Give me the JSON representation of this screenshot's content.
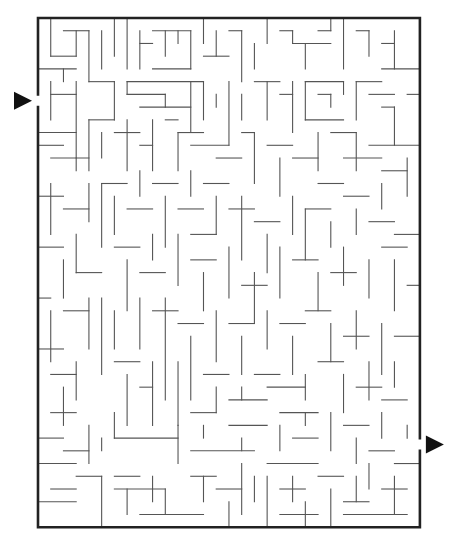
{
  "puzzle": {
    "type": "maze",
    "cols": 30,
    "rows": 40,
    "origin": [
      38,
      18
    ],
    "cell": 12.73,
    "entrance": {
      "side": "left",
      "row": 6,
      "arrow": "right-pointing-triangle"
    },
    "exit": {
      "side": "right",
      "row": 33,
      "arrow": "right-pointing-triangle"
    },
    "colors": {
      "wall": "#555555",
      "border": "#222222",
      "arrow": "#111111",
      "background": "#ffffff"
    }
  },
  "walls": [
    [
      1,
      0,
      1,
      3
    ],
    [
      1,
      3,
      3,
      3
    ],
    [
      3,
      3,
      3,
      1
    ],
    [
      2,
      1,
      4,
      1
    ],
    [
      4,
      1,
      4,
      5
    ],
    [
      5,
      1,
      5,
      4
    ],
    [
      6,
      0,
      6,
      3
    ],
    [
      7,
      0,
      7,
      4
    ],
    [
      8,
      1,
      8,
      4
    ],
    [
      8,
      2,
      9,
      2
    ],
    [
      9,
      1,
      12,
      1
    ],
    [
      10,
      1,
      10,
      3
    ],
    [
      11,
      1,
      11,
      2
    ],
    [
      12,
      1,
      12,
      4
    ],
    [
      9,
      4,
      12,
      4
    ],
    [
      13,
      0,
      13,
      2
    ],
    [
      13,
      3,
      15,
      3
    ],
    [
      14,
      1,
      14,
      3
    ],
    [
      15,
      1,
      16,
      1
    ],
    [
      16,
      1,
      16,
      5
    ],
    [
      17,
      2,
      17,
      4
    ],
    [
      18,
      0,
      18,
      2
    ],
    [
      19,
      1,
      20,
      1
    ],
    [
      20,
      1,
      20,
      2
    ],
    [
      20,
      2,
      23,
      2
    ],
    [
      21,
      2,
      21,
      4
    ],
    [
      22,
      1,
      23,
      1
    ],
    [
      23,
      0,
      23,
      1
    ],
    [
      24,
      0,
      24,
      4
    ],
    [
      25,
      1,
      26,
      1
    ],
    [
      26,
      1,
      26,
      3
    ],
    [
      27,
      2,
      28,
      2
    ],
    [
      28,
      1,
      28,
      4
    ],
    [
      27,
      4,
      30,
      4
    ],
    [
      0,
      4,
      3,
      4
    ],
    [
      2,
      4,
      2,
      5
    ],
    [
      3,
      5,
      3,
      11
    ],
    [
      1,
      6,
      3,
      6
    ],
    [
      1,
      5,
      1,
      8
    ],
    [
      4,
      5,
      6,
      5
    ],
    [
      6,
      5,
      6,
      8
    ],
    [
      7,
      5,
      13,
      5
    ],
    [
      7,
      5,
      7,
      6
    ],
    [
      7,
      6,
      10,
      6
    ],
    [
      10,
      6,
      10,
      7
    ],
    [
      8,
      7,
      12,
      7
    ],
    [
      12,
      5,
      12,
      9
    ],
    [
      13,
      5,
      13,
      8
    ],
    [
      15,
      5,
      15,
      10
    ],
    [
      14,
      6,
      14,
      7
    ],
    [
      16,
      6,
      16,
      8
    ],
    [
      17,
      5,
      19,
      5
    ],
    [
      18,
      5,
      18,
      8
    ],
    [
      19,
      6,
      20,
      6
    ],
    [
      20,
      5,
      20,
      9
    ],
    [
      21,
      5,
      24,
      5
    ],
    [
      21,
      5,
      21,
      8
    ],
    [
      22,
      6,
      23,
      6
    ],
    [
      23,
      6,
      23,
      7
    ],
    [
      21,
      8,
      24,
      8
    ],
    [
      24,
      5,
      24,
      6
    ],
    [
      25,
      5,
      27,
      5
    ],
    [
      25,
      5,
      25,
      8
    ],
    [
      26,
      6,
      28,
      6
    ],
    [
      27,
      7,
      28,
      7
    ],
    [
      28,
      7,
      28,
      10
    ],
    [
      29,
      6,
      30,
      6
    ],
    [
      0,
      9,
      3,
      9
    ],
    [
      0,
      10,
      2,
      10
    ],
    [
      1,
      11,
      4,
      11
    ],
    [
      3,
      11,
      3,
      12
    ],
    [
      4,
      8,
      6,
      8
    ],
    [
      4,
      8,
      4,
      12
    ],
    [
      5,
      9,
      5,
      11
    ],
    [
      6,
      9,
      8,
      9
    ],
    [
      7,
      8,
      7,
      12
    ],
    [
      8,
      10,
      9,
      10
    ],
    [
      9,
      8,
      9,
      12
    ],
    [
      10,
      8,
      11,
      8
    ],
    [
      11,
      9,
      13,
      9
    ],
    [
      11,
      9,
      11,
      12
    ],
    [
      12,
      10,
      15,
      10
    ],
    [
      14,
      11,
      16,
      11
    ],
    [
      16,
      9,
      17,
      9
    ],
    [
      17,
      9,
      17,
      13
    ],
    [
      18,
      10,
      20,
      10
    ],
    [
      19,
      11,
      19,
      14
    ],
    [
      20,
      11,
      22,
      11
    ],
    [
      22,
      9,
      22,
      12
    ],
    [
      23,
      9,
      25,
      9
    ],
    [
      25,
      9,
      25,
      12
    ],
    [
      26,
      10,
      30,
      10
    ],
    [
      24,
      11,
      27,
      11
    ],
    [
      27,
      12,
      29,
      12
    ],
    [
      29,
      11,
      29,
      14
    ],
    [
      0,
      14,
      2,
      14
    ],
    [
      1,
      13,
      1,
      17
    ],
    [
      2,
      15,
      4,
      15
    ],
    [
      4,
      13,
      4,
      16
    ],
    [
      5,
      13,
      7,
      13
    ],
    [
      5,
      13,
      5,
      18
    ],
    [
      6,
      14,
      6,
      17
    ],
    [
      7,
      15,
      9,
      15
    ],
    [
      8,
      12,
      8,
      14
    ],
    [
      9,
      13,
      11,
      13
    ],
    [
      10,
      14,
      10,
      18
    ],
    [
      11,
      15,
      13,
      15
    ],
    [
      12,
      12,
      12,
      14
    ],
    [
      13,
      13,
      15,
      13
    ],
    [
      14,
      14,
      14,
      17
    ],
    [
      15,
      15,
      17,
      15
    ],
    [
      16,
      14,
      16,
      19
    ],
    [
      17,
      16,
      19,
      16
    ],
    [
      18,
      17,
      18,
      20
    ],
    [
      20,
      14,
      20,
      17
    ],
    [
      21,
      15,
      23,
      15
    ],
    [
      21,
      15,
      21,
      19
    ],
    [
      22,
      13,
      24,
      13
    ],
    [
      23,
      16,
      23,
      18
    ],
    [
      24,
      14,
      26,
      14
    ],
    [
      25,
      15,
      25,
      17
    ],
    [
      26,
      16,
      28,
      16
    ],
    [
      27,
      13,
      27,
      15
    ],
    [
      28,
      17,
      30,
      17
    ],
    [
      0,
      18,
      2,
      18
    ],
    [
      2,
      19,
      2,
      22
    ],
    [
      3,
      17,
      3,
      20
    ],
    [
      3,
      20,
      5,
      20
    ],
    [
      6,
      18,
      8,
      18
    ],
    [
      7,
      19,
      7,
      23
    ],
    [
      8,
      20,
      10,
      20
    ],
    [
      9,
      17,
      9,
      19
    ],
    [
      11,
      17,
      11,
      21
    ],
    [
      12,
      17,
      14,
      17
    ],
    [
      12,
      19,
      14,
      19
    ],
    [
      13,
      20,
      13,
      23
    ],
    [
      15,
      18,
      15,
      22
    ],
    [
      16,
      21,
      18,
      21
    ],
    [
      17,
      20,
      17,
      24
    ],
    [
      19,
      18,
      19,
      22
    ],
    [
      20,
      19,
      22,
      19
    ],
    [
      22,
      20,
      22,
      23
    ],
    [
      23,
      20,
      25,
      20
    ],
    [
      24,
      18,
      24,
      21
    ],
    [
      26,
      19,
      26,
      22
    ],
    [
      27,
      18,
      29,
      18
    ],
    [
      28,
      19,
      28,
      23
    ],
    [
      29,
      21,
      30,
      21
    ],
    [
      0,
      22,
      1,
      22
    ],
    [
      1,
      23,
      1,
      27
    ],
    [
      2,
      23,
      4,
      23
    ],
    [
      4,
      22,
      4,
      26
    ],
    [
      5,
      22,
      5,
      28
    ],
    [
      6,
      23,
      6,
      26
    ],
    [
      8,
      22,
      8,
      26
    ],
    [
      9,
      23,
      11,
      23
    ],
    [
      10,
      22,
      10,
      30
    ],
    [
      11,
      24,
      13,
      24
    ],
    [
      12,
      25,
      12,
      30
    ],
    [
      14,
      23,
      14,
      27
    ],
    [
      15,
      24,
      17,
      24
    ],
    [
      16,
      25,
      16,
      28
    ],
    [
      18,
      23,
      18,
      26
    ],
    [
      19,
      24,
      21,
      24
    ],
    [
      20,
      25,
      20,
      28
    ],
    [
      21,
      23,
      23,
      23
    ],
    [
      23,
      24,
      23,
      27
    ],
    [
      24,
      25,
      26,
      25
    ],
    [
      25,
      23,
      25,
      26
    ],
    [
      27,
      24,
      27,
      28
    ],
    [
      28,
      25,
      30,
      25
    ],
    [
      0,
      26,
      2,
      26
    ],
    [
      1,
      28,
      3,
      28
    ],
    [
      3,
      27,
      3,
      30
    ],
    [
      2,
      29,
      2,
      32
    ],
    [
      6,
      27,
      8,
      27
    ],
    [
      7,
      28,
      7,
      32
    ],
    [
      8,
      29,
      9,
      29
    ],
    [
      9,
      27,
      9,
      32
    ],
    [
      11,
      27,
      11,
      32
    ],
    [
      13,
      28,
      15,
      28
    ],
    [
      14,
      29,
      14,
      31
    ],
    [
      15,
      30,
      18,
      30
    ],
    [
      16,
      29,
      16,
      30
    ],
    [
      17,
      28,
      19,
      28
    ],
    [
      18,
      29,
      21,
      29
    ],
    [
      19,
      31,
      22,
      31
    ],
    [
      21,
      28,
      21,
      30
    ],
    [
      22,
      27,
      24,
      27
    ],
    [
      24,
      28,
      24,
      31
    ],
    [
      25,
      29,
      27,
      29
    ],
    [
      26,
      27,
      26,
      30
    ],
    [
      27,
      30,
      29,
      30
    ],
    [
      28,
      27,
      28,
      29
    ],
    [
      1,
      31,
      3,
      31
    ],
    [
      0,
      33,
      2,
      33
    ],
    [
      2,
      34,
      4,
      34
    ],
    [
      4,
      32,
      4,
      35
    ],
    [
      3,
      36,
      5,
      36
    ],
    [
      5,
      33,
      5,
      34
    ],
    [
      6,
      31,
      6,
      33
    ],
    [
      6,
      33,
      11,
      33
    ],
    [
      11,
      32,
      11,
      35
    ],
    [
      12,
      34,
      17,
      34
    ],
    [
      12,
      31,
      14,
      31
    ],
    [
      13,
      32,
      13,
      33
    ],
    [
      15,
      32,
      18,
      32
    ],
    [
      16,
      33,
      16,
      34
    ],
    [
      19,
      32,
      19,
      34
    ],
    [
      20,
      33,
      22,
      33
    ],
    [
      21,
      31,
      21,
      32
    ],
    [
      23,
      31,
      23,
      34
    ],
    [
      24,
      32,
      26,
      32
    ],
    [
      25,
      33,
      25,
      35
    ],
    [
      26,
      34,
      28,
      34
    ],
    [
      27,
      31,
      27,
      33
    ],
    [
      28,
      35,
      30,
      35
    ],
    [
      29,
      32,
      29,
      33
    ],
    [
      0,
      35,
      3,
      35
    ],
    [
      1,
      37,
      3,
      37
    ],
    [
      0,
      38,
      3,
      38
    ],
    [
      5,
      36,
      5,
      40
    ],
    [
      6,
      37,
      10,
      37
    ],
    [
      6,
      36,
      8,
      36
    ],
    [
      7,
      37,
      7,
      39
    ],
    [
      9,
      36,
      9,
      38
    ],
    [
      8,
      39,
      13,
      39
    ],
    [
      10,
      37,
      10,
      39
    ],
    [
      12,
      36,
      14,
      36
    ],
    [
      13,
      36,
      13,
      38
    ],
    [
      14,
      37,
      16,
      37
    ],
    [
      15,
      38,
      15,
      40
    ],
    [
      16,
      35,
      16,
      39
    ],
    [
      17,
      36,
      17,
      38
    ],
    [
      18,
      35,
      22,
      35
    ],
    [
      18,
      36,
      18,
      40
    ],
    [
      19,
      37,
      21,
      37
    ],
    [
      20,
      36,
      20,
      38
    ],
    [
      19,
      39,
      22,
      39
    ],
    [
      21,
      38,
      21,
      40
    ],
    [
      22,
      36,
      24,
      36
    ],
    [
      23,
      37,
      23,
      40
    ],
    [
      24,
      38,
      26,
      38
    ],
    [
      25,
      36,
      25,
      38
    ],
    [
      26,
      35,
      26,
      37
    ],
    [
      27,
      37,
      29,
      37
    ],
    [
      28,
      36,
      28,
      39
    ],
    [
      24,
      39,
      29,
      39
    ]
  ]
}
